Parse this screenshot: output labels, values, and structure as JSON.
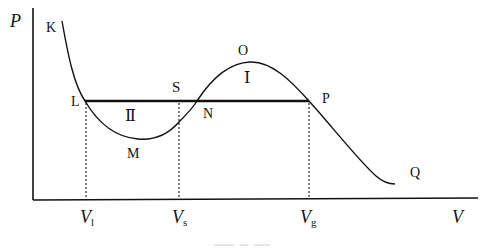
{
  "diagram": {
    "type": "pv-isotherm-maxwell-construction",
    "axes": {
      "y_label": "P",
      "x_label": "V"
    },
    "points": {
      "K": "K",
      "L": "L",
      "M": "M",
      "S": "S",
      "N": "N",
      "O": "O",
      "P": "P",
      "Q": "Q"
    },
    "regions": {
      "upper": "Ⅰ",
      "lower": "Ⅱ"
    },
    "x_ticks": [
      {
        "main": "V",
        "sub": "l"
      },
      {
        "main": "V",
        "sub": "s"
      },
      {
        "main": "V",
        "sub": "g"
      }
    ],
    "colors": {
      "line": "#111111",
      "background": "#ffffff"
    }
  }
}
